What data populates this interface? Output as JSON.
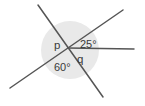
{
  "figure": {
    "background_color": "#ffffff",
    "shade_color": "#e9e9e9",
    "line_color": "#555555",
    "text_color": "#3a3a3a",
    "vertex": {
      "x": 68,
      "y": 48
    },
    "shaded_disc": {
      "cx": 70,
      "cy": 50,
      "r": 29
    },
    "lines": [
      {
        "name": "line-steep",
        "description": "steep line from upper-left to lower-right through vertex",
        "x1": 38,
        "y1": 5,
        "x2": 103,
        "y2": 97
      },
      {
        "name": "line-shallow",
        "description": "shallow line from lower-left to upper-right through vertex",
        "x1": 10,
        "y1": 88,
        "x2": 123,
        "y2": 10
      },
      {
        "name": "ray-horizontal",
        "description": "horizontal ray from vertex to the right",
        "x1": 68,
        "y1": 48,
        "x2": 134,
        "y2": 49
      }
    ],
    "labels": [
      {
        "name": "angle-label-p",
        "text": "p",
        "x": 54,
        "y": 49,
        "kind": "variable"
      },
      {
        "name": "angle-label-25",
        "text": "25°",
        "x": 80,
        "y": 48,
        "kind": "degrees"
      },
      {
        "name": "angle-label-q",
        "text": "q",
        "x": 77,
        "y": 63,
        "kind": "variable"
      },
      {
        "name": "angle-label-60",
        "text": "60°",
        "x": 54,
        "y": 71,
        "kind": "degrees"
      }
    ]
  }
}
